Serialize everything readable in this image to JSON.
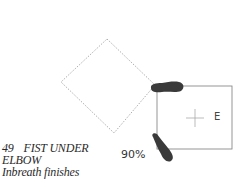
{
  "figure": {
    "step_number": "49",
    "title_line1": "FIST UNDER",
    "title_line2": "ELBOW",
    "subtitle": "Inbreath finishes",
    "percentage": "90%",
    "direction_label": "E"
  },
  "shapes": {
    "diamond": {
      "style": "dotted",
      "points": [
        [
          107,
          39
        ],
        [
          155,
          85
        ],
        [
          114,
          133
        ],
        [
          61,
          82
        ]
      ]
    },
    "rectangle": {
      "style": "solid",
      "x": 157,
      "y": 86,
      "width": 75,
      "height": 63
    },
    "center_cross": {
      "x": 195,
      "y": 118
    },
    "footprints": [
      "top-horizontal-foot",
      "bottom-angled-foot"
    ]
  },
  "colors": {
    "line": "#8a8a8a",
    "foot": "#3a3a3a",
    "text": "#2a2a2a"
  }
}
